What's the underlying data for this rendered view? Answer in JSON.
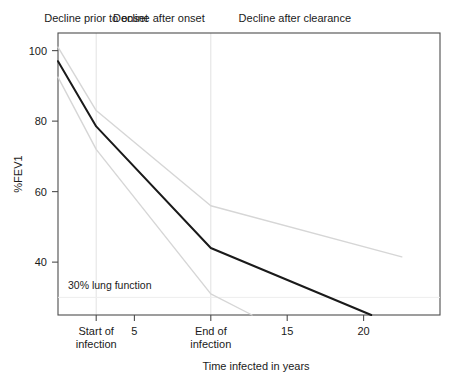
{
  "chart_data": {
    "type": "line",
    "title": "",
    "xlabel": "Time infected in years",
    "ylabel": "%FEV1",
    "xlim": [
      0,
      25
    ],
    "ylim": [
      25,
      105
    ],
    "grid": false,
    "legend": null,
    "x_ticks": [
      {
        "value": 2.5,
        "label_line1": "Start of",
        "label_line2": "infection"
      },
      {
        "value": 5,
        "label_line1": "5",
        "label_line2": ""
      },
      {
        "value": 10,
        "label_line1": "End of",
        "label_line2": "infection"
      },
      {
        "value": 15,
        "label_line1": "15",
        "label_line2": ""
      },
      {
        "value": 20,
        "label_line1": "20",
        "label_line2": ""
      }
    ],
    "y_ticks": [
      {
        "value": 100,
        "label": "100"
      },
      {
        "value": 80,
        "label": "80"
      },
      {
        "value": 60,
        "label": "60"
      },
      {
        "value": 40,
        "label": "40"
      }
    ],
    "phase_labels": [
      {
        "id": "phase-1",
        "text": "Decline prior to onset",
        "x_center": 2.5
      },
      {
        "id": "phase-2",
        "text": "Decline after onset",
        "x_center": 6.6
      },
      {
        "id": "phase-3",
        "text": "Decline after clearance",
        "x_center": 15.5
      }
    ],
    "phase_dividers": [
      2.5,
      10.0
    ],
    "threshold": {
      "value": 30,
      "label": "30% lung function"
    },
    "series": [
      {
        "name": "upper-bound",
        "color": "#d6d6d6",
        "points": [
          [
            0.0,
            101.0
          ],
          [
            2.5,
            83.0
          ],
          [
            10.0,
            56.0
          ],
          [
            22.5,
            41.5
          ]
        ]
      },
      {
        "name": "mean-decline",
        "color": "#1a1a1a",
        "points": [
          [
            0.0,
            97.0
          ],
          [
            2.5,
            78.5
          ],
          [
            10.0,
            44.0
          ],
          [
            20.5,
            25.0
          ]
        ]
      },
      {
        "name": "lower-bound",
        "color": "#d6d6d6",
        "points": [
          [
            0.0,
            92.5
          ],
          [
            2.5,
            72.0
          ],
          [
            10.0,
            31.0
          ],
          [
            12.7,
            25.0
          ]
        ]
      }
    ]
  }
}
